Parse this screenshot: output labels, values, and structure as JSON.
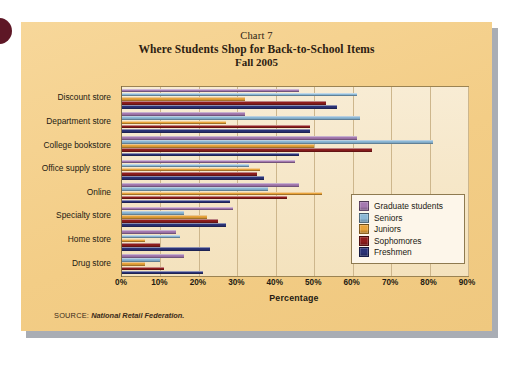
{
  "figure": {
    "chart_number": "Chart 7",
    "title": "Where Students Shop for Back-to-School Items",
    "subtitle": "Fall 2005",
    "source_label": "SOURCE:",
    "source_value": "National Retail Federation."
  },
  "legend": {
    "position": "inside-right",
    "items": [
      {
        "label": "Graduate students",
        "color": "#a579b0"
      },
      {
        "label": "Seniors",
        "color": "#8cb8d6"
      },
      {
        "label": "Juniors",
        "color": "#e8a33a"
      },
      {
        "label": "Sophomores",
        "color": "#8f1d1d"
      },
      {
        "label": "Freshmen",
        "color": "#2b3377"
      }
    ]
  },
  "chart_data": {
    "type": "bar",
    "orientation": "horizontal",
    "title": "Where Students Shop for Back-to-School Items",
    "subtitle": "Fall 2005",
    "xlabel": "Percentage",
    "ylabel": "",
    "xlim": [
      0,
      90
    ],
    "xticks": [
      0,
      10,
      20,
      30,
      40,
      50,
      60,
      70,
      80,
      90
    ],
    "xticklabels": [
      "0%",
      "10%",
      "20%",
      "30%",
      "40%",
      "50%",
      "60%",
      "70%",
      "80%",
      "90%"
    ],
    "grid": true,
    "legend_position": "inside-right",
    "categories": [
      "Discount store",
      "Department store",
      "College bookstore",
      "Office supply store",
      "Online",
      "Specialty store",
      "Home store",
      "Drug store"
    ],
    "series": [
      {
        "name": "Graduate students",
        "color": "#a579b0",
        "values": [
          46,
          32,
          61,
          45,
          46,
          29,
          14,
          16
        ]
      },
      {
        "name": "Seniors",
        "color": "#8cb8d6",
        "values": [
          61,
          62,
          81,
          33,
          38,
          16,
          15,
          10
        ]
      },
      {
        "name": "Juniors",
        "color": "#e8a33a",
        "values": [
          32,
          27,
          50,
          36,
          52,
          22,
          6,
          6
        ]
      },
      {
        "name": "Sophomores",
        "color": "#8f1d1d",
        "values": [
          53,
          49,
          65,
          35,
          43,
          25,
          10,
          11
        ]
      },
      {
        "name": "Freshmen",
        "color": "#2b3377",
        "values": [
          56,
          49,
          46,
          37,
          28,
          27,
          23,
          21
        ]
      }
    ]
  }
}
